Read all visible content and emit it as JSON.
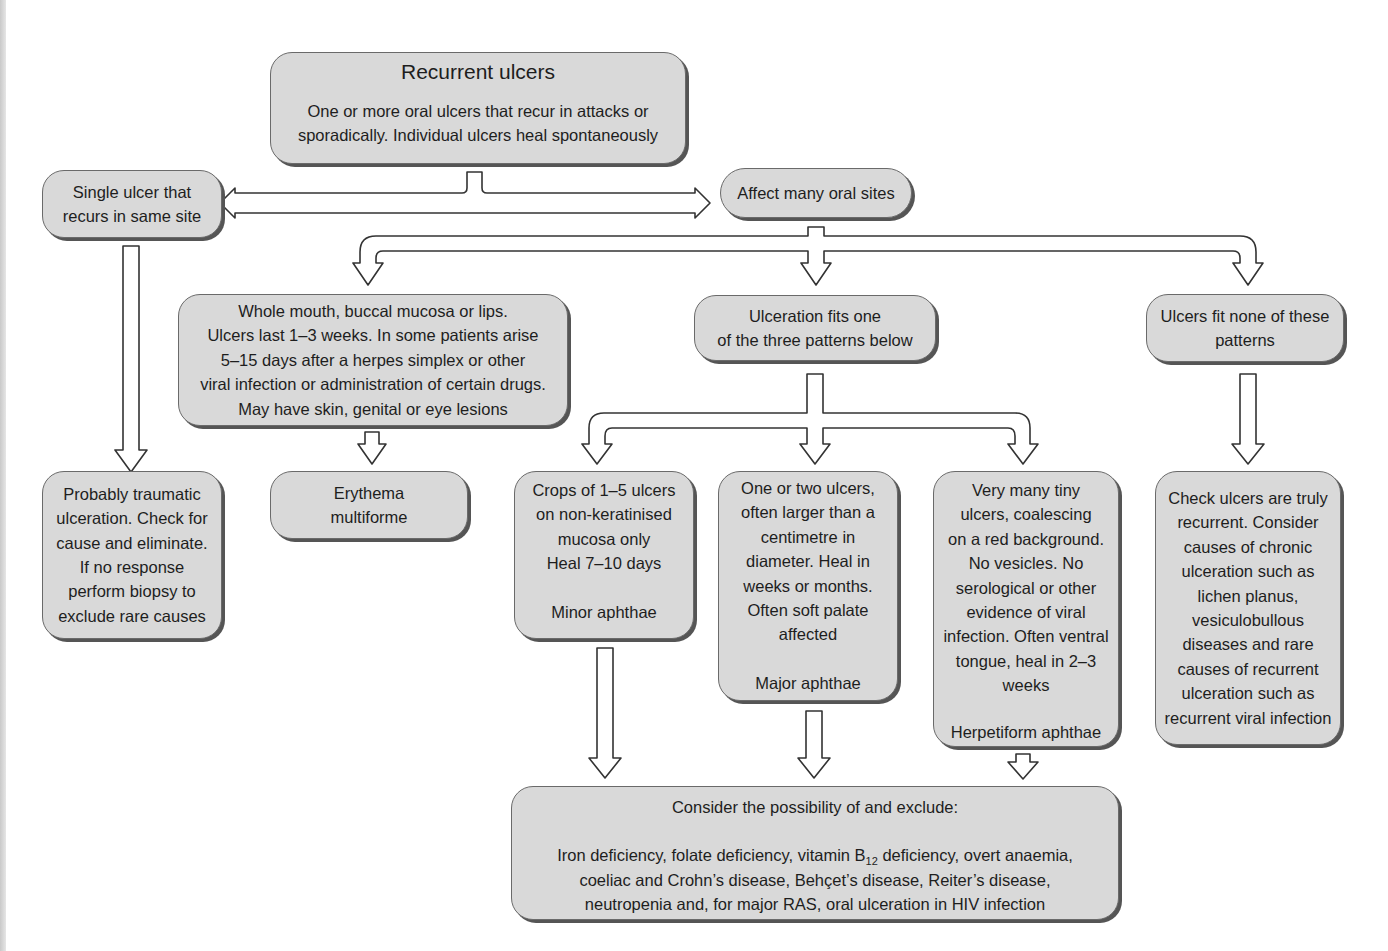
{
  "diagram": {
    "root": {
      "title": "Recurrent ulcers",
      "lines": [
        "One or more oral ulcers that recur in attacks or",
        "sporadically. Individual ulcers heal spontaneously"
      ]
    },
    "single_site": {
      "lines": [
        "Single ulcer that",
        "recurs in same site"
      ]
    },
    "many_sites": {
      "lines": [
        "Affect many oral sites"
      ]
    },
    "traumatic": {
      "lines": [
        "Probably traumatic",
        "ulceration. Check for",
        "cause and eliminate.",
        "If no response",
        "perform biopsy to",
        "exclude rare causes"
      ]
    },
    "whole_mouth": {
      "lines": [
        "Whole mouth, buccal mucosa or lips.",
        "Ulcers last 1–3 weeks. In some patients arise",
        "5–15 days after a herpes simplex or other",
        "viral infection or administration of certain drugs.",
        "May have skin, genital or eye lesions"
      ]
    },
    "erythema": {
      "lines": [
        "Erythema",
        "multiforme"
      ]
    },
    "fits_pattern": {
      "lines": [
        "Ulceration fits one",
        "of the three patterns below"
      ]
    },
    "fits_none": {
      "lines": [
        "Ulcers fit none of these",
        "patterns"
      ]
    },
    "minor": {
      "lines": [
        "Crops of 1–5 ulcers",
        "on non-keratinised",
        "mucosa only",
        "Heal 7–10 days"
      ],
      "label": "Minor aphthae"
    },
    "major": {
      "lines": [
        "One or two ulcers,",
        "often larger than a",
        "centimetre in",
        "diameter. Heal in",
        "weeks or months.",
        "Often soft palate",
        "affected"
      ],
      "label": "Major aphthae"
    },
    "herpetiform": {
      "lines": [
        "Very many tiny",
        "ulcers, coalescing",
        "on a red background.",
        "No vesicles. No",
        "serological or other",
        "evidence of viral",
        "infection. Often ventral",
        "tongue, heal in 2–3",
        "weeks"
      ],
      "label": "Herpetiform aphthae"
    },
    "check_recurrent": {
      "lines": [
        "Check ulcers are truly",
        "recurrent. Consider",
        "causes of chronic",
        "ulceration such as",
        "lichen planus,",
        "vesiculobullous",
        "diseases and rare",
        "causes of recurrent",
        "ulceration such as",
        "recurrent viral infection"
      ]
    },
    "exclude": {
      "heading": "Consider the possibility of and exclude:",
      "line1_pre": "Iron deficiency, folate deficiency, vitamin B",
      "line1_sub": "12",
      "line1_post": " deficiency, overt anaemia,",
      "line2": "coeliac and Crohn’s disease, Behçet’s disease, Reiter’s disease,",
      "line3": "neutropenia and, for major RAS, oral ulceration in HIV infection"
    }
  },
  "colors": {
    "box_fill": "#d9d9d9",
    "box_border": "#6a6a6a",
    "box_shadow": "#555555",
    "arrow_fill": "#ffffff",
    "arrow_stroke": "#333333"
  }
}
